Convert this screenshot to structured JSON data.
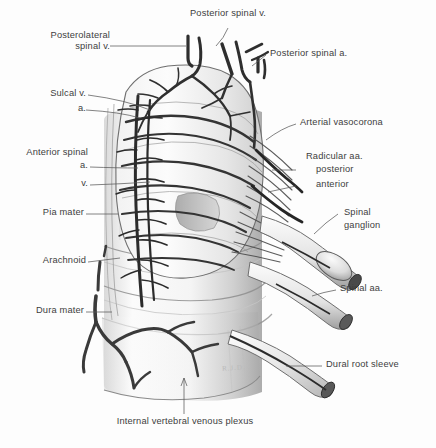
{
  "figure": {
    "background_color": "#fdfdfd",
    "ink_color": "#3d3d3d",
    "width": 436,
    "height": 448
  },
  "labels": {
    "posterior_spinal_v": "Posterior spinal v.",
    "posterolateral_spinal_v_line1": "Posterolateral",
    "posterolateral_spinal_v_line2": "spinal v.",
    "posterior_spinal_a": "Posterior spinal a.",
    "sulcal_v": "Sulcal v.",
    "sulcal_a": "a.",
    "arterial_vasocorona": "Arterial vasocorona",
    "anterior_spinal_line1": "Anterior spinal",
    "anterior_spinal_a": "a.",
    "anterior_spinal_v": "v.",
    "radicular_aa": "Radicular aa.",
    "radicular_posterior": "posterior",
    "radicular_anterior": "anterior",
    "pia_mater": "Pia mater",
    "spinal_ganglion_line1": "Spinal",
    "spinal_ganglion_line2": "ganglion",
    "arachnoid": "Arachnoid",
    "spinal_aa": "Spinal aa.",
    "dura_mater": "Dura mater",
    "dural_root_sleeve": "Dural root sleeve",
    "internal_vertebral_venous_plexus": "Internal vertebral venous plexus",
    "artist_signature": "R.J.D."
  }
}
